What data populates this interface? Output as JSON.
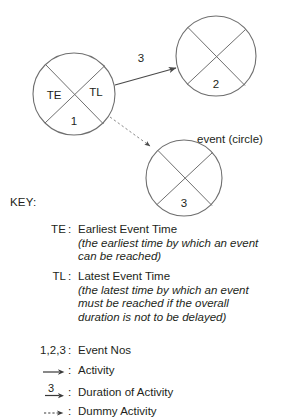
{
  "diagram": {
    "title_hint": "PERT / network analysis event notation",
    "annotation": {
      "event_circle_label": "event (circle)"
    },
    "nodes": [
      {
        "id": "event-1",
        "number": "1",
        "cx": 74,
        "cy": 94,
        "r": 41,
        "quadrant_labels": {
          "left": "TE",
          "right": "TL",
          "bottom": "1"
        }
      },
      {
        "id": "event-2",
        "number": "2",
        "cx": 216,
        "cy": 56,
        "r": 40,
        "quadrant_labels": {
          "left": "",
          "right": "",
          "bottom": "2"
        }
      },
      {
        "id": "event-3",
        "number": "3",
        "cx": 184,
        "cy": 178,
        "r": 38,
        "quadrant_labels": {
          "left": "",
          "right": "",
          "bottom": "3"
        }
      }
    ],
    "edges": [
      {
        "id": "activity-1-2",
        "from": "event-1",
        "to": "event-2",
        "style": "solid",
        "duration_label": "3",
        "x1": 115,
        "y1": 85,
        "x2": 176,
        "y2": 68
      },
      {
        "id": "dummy-1-3",
        "from": "event-1",
        "to": "event-3",
        "style": "dashed",
        "duration_label": "",
        "x1": 110,
        "y1": 117,
        "x2": 150,
        "y2": 146
      }
    ]
  },
  "key": {
    "heading": "KEY:",
    "entries": [
      {
        "term": "TE",
        "symbol": "",
        "definition": "Earliest Event Time",
        "gloss": "(the earliest time by which an event can be reached)"
      },
      {
        "term": "TL",
        "symbol": "",
        "definition": "Latest Event Time",
        "gloss": "(the latest time by which an event must be reached if the overall duration is not to be delayed)"
      },
      {
        "term": "1,2,3",
        "symbol": "",
        "definition": "Event Nos",
        "gloss": ""
      },
      {
        "term": "",
        "symbol": "solid-arrow-icon",
        "definition": "Activity",
        "gloss": ""
      },
      {
        "term": "",
        "symbol": "numbered-arrow-icon",
        "symbol_number": "3",
        "definition": "Duration of Activity",
        "gloss": ""
      },
      {
        "term": "",
        "symbol": "dashed-arrow-icon",
        "definition": "Dummy Activity",
        "gloss": ""
      }
    ]
  },
  "colors": {
    "stroke": "#6f6f6f",
    "text": "#231f20",
    "background": "#ffffff"
  }
}
